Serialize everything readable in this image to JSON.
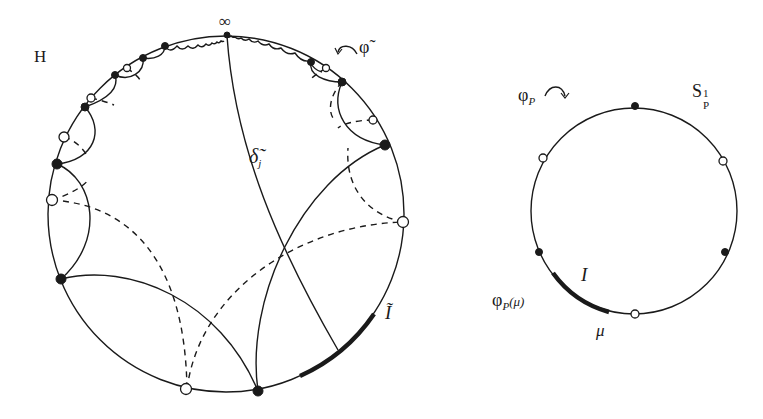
{
  "left_diagram": {
    "name": "hyperbolic-disk-H",
    "label_H": "H",
    "label_infinity": "∞",
    "label_phi_tilde": "φ̃",
    "label_delta": "δ̃",
    "label_delta_sub": "j",
    "label_I_tilde": "Ĩ",
    "circle": {
      "cx": 226,
      "cy": 214,
      "r": 178
    },
    "filled_points_deg": [
      90,
      120.5,
      126,
      134,
      147,
      164,
      183.5,
      220,
      271,
      42.5,
      60,
      68.5
    ],
    "open_points_deg": [
      116,
      130,
      140,
      154,
      197,
      236,
      63,
      48,
      354
    ]
  },
  "right_diagram": {
    "name": "circle-S1P",
    "label_S": "S",
    "label_S_sup": "1",
    "label_S_sub": "P",
    "label_phiP": "φ",
    "label_phiP_sub": "P",
    "label_phiP_mu": "φ",
    "label_phiP_mu_sub": "P",
    "label_phiP_mu_arg": "(μ)",
    "label_I": "I",
    "label_mu": "μ",
    "circle": {
      "cx": 634,
      "cy": 211,
      "r": 103
    },
    "filled_points_deg": [
      90,
      210,
      330
    ],
    "open_points_deg": [
      150,
      30,
      270
    ]
  },
  "colors": {
    "stroke": "#1a1a1a",
    "background": "#ffffff"
  }
}
